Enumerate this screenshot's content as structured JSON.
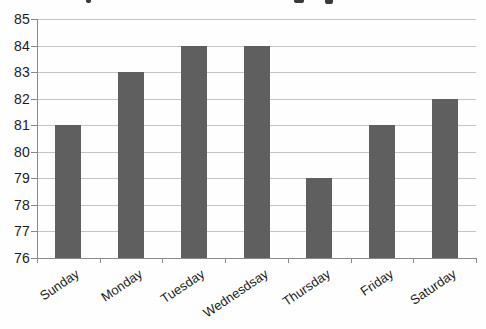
{
  "chart_data": {
    "type": "bar",
    "title": "",
    "title_note": "title cropped off at top edge of screenshot; only letter descenders visible",
    "categories": [
      "Sunday",
      "Monday",
      "Tuesday",
      "Wednesdsay",
      "Thursday",
      "Friday",
      "Saturday"
    ],
    "values": [
      81,
      83,
      84,
      84,
      79,
      81,
      82
    ],
    "yticks": [
      85,
      84,
      83,
      82,
      81,
      80,
      79,
      78,
      77,
      76
    ],
    "ylim": [
      76,
      85
    ],
    "xlabel": "",
    "ylabel": "",
    "grid": true,
    "legend": false,
    "colors": {
      "bar": "#5f5f5f",
      "gridline": "#c4c4c4",
      "axis": "#8a8a8a",
      "tick": "#8a8a8a",
      "text": "#1c1c1c",
      "background": "#fefefe"
    }
  }
}
